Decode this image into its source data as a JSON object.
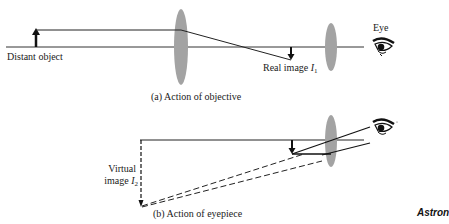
{
  "figure": {
    "panel_a": {
      "caption": "(a) Action of objective",
      "labels": {
        "object": "Distant object",
        "real_image": "Real image",
        "real_image_symbol": "I",
        "real_image_subscript": "1",
        "eye": "Eye"
      }
    },
    "panel_b": {
      "caption": "(b) Action of eyepiece",
      "labels": {
        "virtual_image_line1": "Virtual",
        "virtual_image_line2": "image",
        "virtual_image_symbol": "I",
        "virtual_image_subscript": "2"
      }
    },
    "cutoff_title": "Astron"
  },
  "colors": {
    "lens": "#9a9a9a",
    "line": "#1a1a1a",
    "background": "#ffffff"
  }
}
